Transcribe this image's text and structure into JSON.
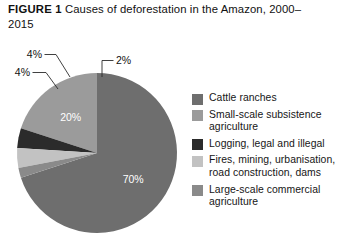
{
  "title": {
    "label": "FIGURE 1",
    "text": "Causes of deforestation in the Amazon, 2000–2015"
  },
  "chart_data": {
    "type": "pie",
    "title": "Causes of deforestation in the Amazon, 2000–2015",
    "unit": "%",
    "total": 100,
    "legend_position": "right",
    "start_angle_deg": 0,
    "direction": "clockwise",
    "categories": [
      "Cattle ranches",
      "Small-scale subsistence agriculture",
      "Logging, legal and illegal",
      "Fires, mining, urbanisation, road construction, dams",
      "Large-scale commercial agriculture"
    ],
    "values": [
      70,
      20,
      4,
      4,
      2
    ],
    "labels": [
      "70%",
      "20%",
      "4%",
      "4%",
      "2%"
    ],
    "colors": [
      "#6e6e6e",
      "#9b9b9b",
      "#2b2b2b",
      "#c2c2c2",
      "#8a8a8a"
    ],
    "label_placement": [
      "inside",
      "inside",
      "callout",
      "callout",
      "callout"
    ]
  },
  "legend": {
    "items": [
      {
        "label": "Cattle ranches",
        "color": "#6e6e6e",
        "value": 70
      },
      {
        "label": "Small-scale subsistence agriculture",
        "color": "#9b9b9b",
        "value": 20
      },
      {
        "label": "Logging, legal and illegal",
        "color": "#2b2b2b",
        "value": 4
      },
      {
        "label": "Fires, mining, urbanisation, road construction, dams",
        "color": "#c2c2c2",
        "value": 4
      },
      {
        "label": "Large-scale commercial agriculture",
        "color": "#8a8a8a",
        "value": 2
      }
    ]
  }
}
